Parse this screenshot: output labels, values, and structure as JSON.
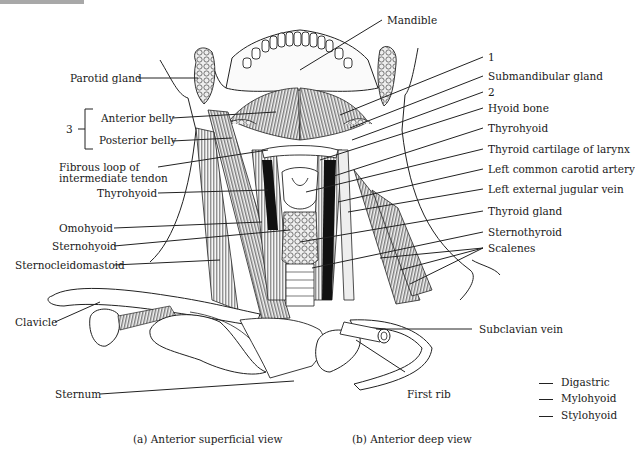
{
  "figure": {
    "left_labels": [
      {
        "id": "parotid-gland",
        "text": "Parotid gland"
      },
      {
        "id": "anterior-belly",
        "text": "Anterior belly"
      },
      {
        "id": "posterior-belly",
        "text": "Posterior belly"
      },
      {
        "id": "fibrous-loop-1",
        "text": "Fibrous loop of"
      },
      {
        "id": "fibrous-loop-2",
        "text": "intermediate tendon"
      },
      {
        "id": "thyrohyoid-left",
        "text": "Thyrohyoid"
      },
      {
        "id": "omohyoid",
        "text": "Omohyoid"
      },
      {
        "id": "sternohyoid",
        "text": "Sternohyoid"
      },
      {
        "id": "sternocleidomastoid",
        "text": "Sternocleidomastoid"
      },
      {
        "id": "clavicle",
        "text": "Clavicle"
      },
      {
        "id": "sternum",
        "text": "Sternum"
      }
    ],
    "group_number": "3",
    "top_label": {
      "id": "mandible",
      "text": "Mandible"
    },
    "right_labels": [
      {
        "id": "num-1",
        "text": "1"
      },
      {
        "id": "submandibular-gland",
        "text": "Submandibular gland"
      },
      {
        "id": "num-2",
        "text": "2"
      },
      {
        "id": "hyoid-bone",
        "text": "Hyoid bone"
      },
      {
        "id": "thyrohyoid-right",
        "text": "Thyrohyoid"
      },
      {
        "id": "thyroid-cartilage",
        "text": "Thyroid cartilage of larynx"
      },
      {
        "id": "left-common-carotid",
        "text": "Left common carotid artery"
      },
      {
        "id": "left-external-jugular",
        "text": "Left external jugular vein"
      },
      {
        "id": "thyroid-gland",
        "text": "Thyroid gland"
      },
      {
        "id": "sternothyroid",
        "text": "Sternothyroid"
      },
      {
        "id": "scalenes",
        "text": "Scalenes"
      },
      {
        "id": "subclavian-vein",
        "text": "Subclavian vein"
      },
      {
        "id": "first-rib",
        "text": "First rib"
      }
    ],
    "captions": {
      "a": "(a) Anterior superficial view",
      "b": "(b) Anterior deep view"
    },
    "legend": [
      {
        "text": "Digastric"
      },
      {
        "text": "Mylohyoid"
      },
      {
        "text": "Stylohyoid"
      }
    ]
  }
}
